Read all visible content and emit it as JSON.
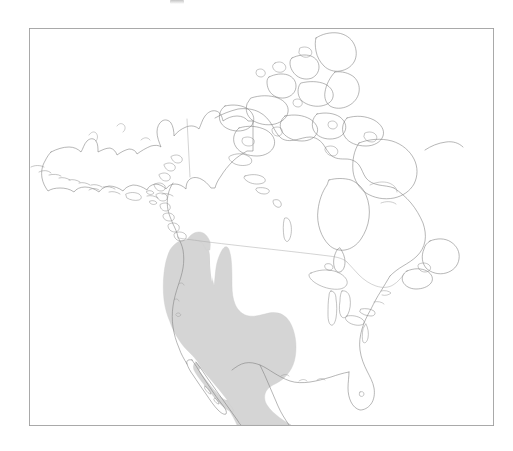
{
  "figure": {
    "kind": "species-distribution-map",
    "region": "North America",
    "projection_note": "",
    "caption_above_partial": "",
    "background_color": "#ffffff",
    "frame": {
      "color": "#a0a0a0",
      "x": 29,
      "y": 28,
      "width": 465,
      "height": 398
    },
    "colors": {
      "coastline": "#7b7b7b",
      "political_border": "#a8a8a8",
      "lake_outline": "#858585",
      "range_fill": "#d5d5d5",
      "range_outline": "#cdcdcd",
      "frame": "#a0a0a0",
      "paper": "#ffffff"
    },
    "legend": {
      "visible": false,
      "entries": []
    },
    "labels": {
      "visible": false,
      "entries": []
    },
    "range_description": {
      "shading_label": "shaded distribution area",
      "extent_summary": "Western North America from southern British Columbia and the Pacific Northwest south through the Intermountain West, Great Basin, Rocky Mountains and Southwest, across Baja California and most of mainland Mexico to the southern edge of the map",
      "clipped_at_bottom": true,
      "internal_gap": true
    },
    "geography": {
      "landmasses": [
        "Alaska",
        "Aleutian Islands",
        "Canada mainland",
        "Canadian Arctic Archipelago",
        "Baffin Island",
        "Ellesmere Island",
        "Victoria Island",
        "Banks Island",
        "Newfoundland",
        "Nova Scotia",
        "Contiguous United States",
        "Florida Peninsula",
        "Baja California Peninsula",
        "Mexico mainland",
        "Vancouver Island",
        "Queen Charlotte Islands"
      ],
      "water_features": [
        "Hudson Bay",
        "James Bay",
        "Great Bear Lake",
        "Great Slave Lake",
        "Lake Winnipeg",
        "Great Lakes",
        "Gulf of Mexico",
        "Gulf of California",
        "Bering Sea",
        "Arctic Ocean",
        "Atlantic Ocean",
        "Pacific Ocean"
      ],
      "political_lines": [
        "United States – Canada border (49th parallel)",
        "Alaska – Yukon border (141st meridian)",
        "Saint Lawrence / northeastern boundary"
      ]
    }
  },
  "chart_data": {
    "type": "map",
    "title": "",
    "xlabel": "",
    "ylabel": "",
    "legend_position": "none",
    "grid": false,
    "series": [
      {
        "name": "shaded distribution area",
        "fill_color": "#d5d5d5",
        "coverage_regions": [
          "southern British Columbia",
          "Washington",
          "Oregon",
          "Idaho",
          "Montana (western)",
          "Wyoming",
          "Nevada",
          "Utah",
          "Colorado",
          "California (eastern and southern)",
          "Arizona",
          "New Mexico",
          "Texas (western)",
          "Baja California",
          "Baja California Sur",
          "Sonora",
          "Chihuahua",
          "Coahuila",
          "Durango",
          "Sinaloa",
          "Zacatecas",
          "San Luis Potosi",
          "Jalisco",
          "Guanajuato",
          "Hidalgo",
          "Veracruz (inland)",
          "Oaxaca (northern)"
        ]
      }
    ]
  }
}
